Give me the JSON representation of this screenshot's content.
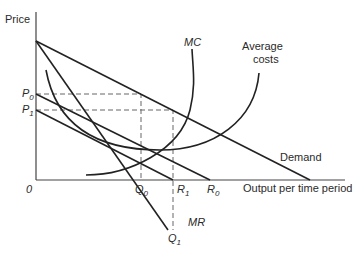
{
  "diagram": {
    "type": "economics-cost-revenue-diagram",
    "y_axis_label": "Price",
    "x_axis_label": "Output per time period",
    "origin_label": "0",
    "curves": {
      "mc": "MC",
      "average_costs_line1": "Average",
      "average_costs_line2": "costs",
      "demand": "Demand",
      "mr": "MR"
    },
    "price_labels": {
      "p0": {
        "main": "P",
        "sub": "0"
      },
      "p1": {
        "main": "P",
        "sub": "1"
      }
    },
    "quantity_labels": {
      "q0": {
        "main": "Q",
        "sub": "0"
      },
      "q1": {
        "main": "Q",
        "sub": "1"
      },
      "r1": {
        "main": "R",
        "sub": "1"
      },
      "r0": {
        "main": "R",
        "sub": "0"
      }
    },
    "colors": {
      "line": "#222222",
      "dashed": "#666666",
      "background": "#ffffff"
    }
  }
}
